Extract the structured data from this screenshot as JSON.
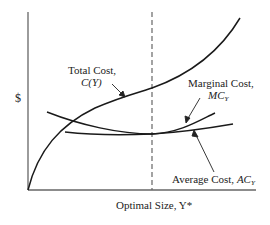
{
  "diagram": {
    "y_axis_label": "$",
    "x_axis_label": "Optimal Size, Y*",
    "curves": [
      {
        "name": "Total Cost",
        "symbol": "C(Y)",
        "label_line1": "Total Cost,",
        "label_line2": "C(Y)"
      },
      {
        "name": "Marginal Cost",
        "symbol": "MC_Y",
        "label_line1": "Marginal Cost,",
        "label_line2": "MC"
      },
      {
        "name": "Average Cost",
        "symbol": "AC_Y",
        "label_text": "Average Cost,",
        "label_sym": "AC"
      }
    ],
    "subscript": "Y",
    "optimal_marker": "dashed vertical line at Y* where MC = AC",
    "colors": {
      "line": "#1a1a1a",
      "axis": "#555555",
      "dashed": "#666666"
    }
  }
}
